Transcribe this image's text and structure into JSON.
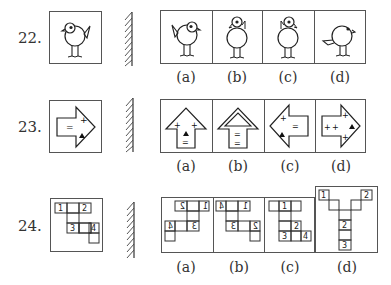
{
  "questions": [
    {
      "number": "22.",
      "figure": "bird-facing-left",
      "mirror": "mirror-line",
      "options": [
        {
          "label": "(a)",
          "figure": "bird-facing-right-tail-left"
        },
        {
          "label": "(b)",
          "figure": "bird-head-top-tilted"
        },
        {
          "label": "(c)",
          "figure": "bird-head-top-tilted-mirrored"
        },
        {
          "label": "(d)",
          "figure": "bird-facing-right-tail-low"
        }
      ]
    },
    {
      "number": "23.",
      "figure": "arrow-right-with-plus-equals-triangle",
      "mirror": "mirror-line",
      "options": [
        {
          "label": "(a)",
          "figure": "arrow-up-plus-plus-triangle-equals"
        },
        {
          "label": "(b)",
          "figure": "arrow-up-double-outline-equals-equals"
        },
        {
          "label": "(c)",
          "figure": "arrow-left-plus-equals-triangle"
        },
        {
          "label": "(d)",
          "figure": "arrow-right-plus-plus-plus-plus-triangle"
        }
      ]
    },
    {
      "number": "24.",
      "figure": "grid-1-2-3-4",
      "cells": [
        "1",
        "2",
        "3",
        "4"
      ],
      "mirror": "mirror-line",
      "options": [
        {
          "label": "(a)",
          "cells": [
            "2",
            "1",
            "4",
            "3"
          ],
          "mirrored_digits": true
        },
        {
          "label": "(b)",
          "cells": [
            "4",
            "1",
            "3",
            "2"
          ],
          "mirrored_digits": true
        },
        {
          "label": "(c)",
          "cells": [
            "1",
            "2",
            "3",
            "4"
          ],
          "mirrored_digits": false
        },
        {
          "label": "(d)",
          "cells": [
            "1",
            "2",
            "2",
            "3"
          ],
          "mirrored_digits": false
        }
      ]
    }
  ]
}
